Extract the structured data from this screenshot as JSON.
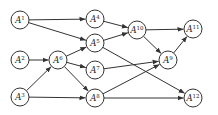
{
  "diagram": {
    "type": "directed-graph",
    "node_symbol": "A",
    "colors": {
      "stroke": "#333333",
      "fill": "#ffffff",
      "text": "#222222"
    },
    "nodes": [
      {
        "id": "A1",
        "base": "A",
        "sup": "1"
      },
      {
        "id": "A2",
        "base": "A",
        "sup": "2"
      },
      {
        "id": "A3",
        "base": "A",
        "sup": "3"
      },
      {
        "id": "A4",
        "base": "A",
        "sup": "4"
      },
      {
        "id": "A5",
        "base": "A",
        "sup": "5"
      },
      {
        "id": "A6",
        "base": "A",
        "sup": "6"
      },
      {
        "id": "A7",
        "base": "A",
        "sup": "7"
      },
      {
        "id": "A8",
        "base": "A",
        "sup": "8"
      },
      {
        "id": "A9",
        "base": "A",
        "sup": "9"
      },
      {
        "id": "A10",
        "base": "A",
        "sup": "10"
      },
      {
        "id": "A11",
        "base": "A",
        "sup": "11"
      },
      {
        "id": "A12",
        "base": "A",
        "sup": "12"
      }
    ],
    "edges": [
      {
        "from": "A1",
        "to": "A4"
      },
      {
        "from": "A1",
        "to": "A5"
      },
      {
        "from": "A2",
        "to": "A6"
      },
      {
        "from": "A3",
        "to": "A6"
      },
      {
        "from": "A3",
        "to": "A8"
      },
      {
        "from": "A6",
        "to": "A5"
      },
      {
        "from": "A6",
        "to": "A7"
      },
      {
        "from": "A6",
        "to": "A8"
      },
      {
        "from": "A4",
        "to": "A10"
      },
      {
        "from": "A5",
        "to": "A10"
      },
      {
        "from": "A5",
        "to": "A12"
      },
      {
        "from": "A7",
        "to": "A9"
      },
      {
        "from": "A8",
        "to": "A9"
      },
      {
        "from": "A8",
        "to": "A12"
      },
      {
        "from": "A10",
        "to": "A11"
      },
      {
        "from": "A10",
        "to": "A9"
      },
      {
        "from": "A9",
        "to": "A11"
      }
    ]
  }
}
